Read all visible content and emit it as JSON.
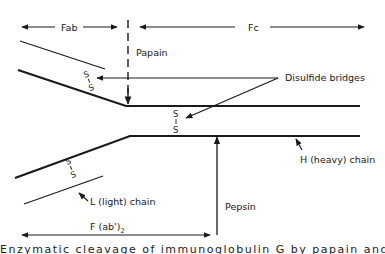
{
  "diagram": {
    "regions": {
      "fab": "Fab",
      "fc": "Fc",
      "fab2_base": "F (ab')",
      "fab2_sub": "2"
    },
    "enzymes": {
      "papain": "Papain",
      "pepsin": "Pepsin"
    },
    "labels": {
      "disulfide": "Disulfide bridges",
      "heavy_chain": "H (heavy) chain",
      "light_chain": "L (light) chain"
    },
    "disulfide_symbol": {
      "top": "S",
      "bottom": "S"
    },
    "caption_cutoff": "Figure caption (cut off at bottom edge)"
  },
  "colors": {
    "ink": "#1a1a1a",
    "background": "#ffffff"
  }
}
